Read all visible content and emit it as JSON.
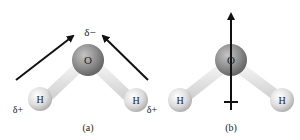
{
  "panel_a": {
    "caption": "(a)",
    "atom_o": "O",
    "atom_h1": "H",
    "atom_h2": "H",
    "charge_o": "δ−",
    "charge_h1": "δ+",
    "charge_h2": "δ+"
  },
  "panel_b": {
    "caption": "(b)",
    "atom_o": "O",
    "atom_h1": "H",
    "atom_h2": "H"
  },
  "colors": {
    "oxygen": "#8a8a8a",
    "hydrogen": "#d9d9d9",
    "bond": "#e4e4e4",
    "arrow": "#111111"
  }
}
